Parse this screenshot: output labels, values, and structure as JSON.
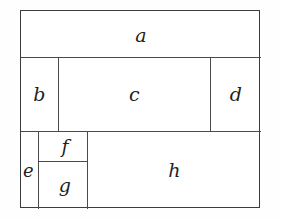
{
  "figure": {
    "outer_border_color": "#3c3c40",
    "divider_color": "#4a4a4e",
    "background_color": "#ffffff",
    "label_color": "#1f1f24",
    "regions": [
      {
        "id": "a",
        "label": "a",
        "row": 1,
        "x": 0,
        "y": 0,
        "w": 240,
        "h": 47
      },
      {
        "id": "b",
        "label": "b",
        "row": 2,
        "x": 0,
        "y": 47,
        "w": 38,
        "h": 74
      },
      {
        "id": "c",
        "label": "c",
        "row": 2,
        "x": 38,
        "y": 47,
        "w": 152,
        "h": 74
      },
      {
        "id": "d",
        "label": "d",
        "row": 2,
        "x": 190,
        "y": 47,
        "w": 50,
        "h": 74
      },
      {
        "id": "e",
        "label": "e",
        "row": 3,
        "x": 0,
        "y": 121,
        "w": 18,
        "h": 77
      },
      {
        "id": "f",
        "label": "f",
        "row": 3,
        "x": 18,
        "y": 121,
        "w": 49,
        "h": 30
      },
      {
        "id": "g",
        "label": "g",
        "row": 3,
        "x": 18,
        "y": 151,
        "w": 49,
        "h": 47
      },
      {
        "id": "h",
        "label": "h",
        "row": 3,
        "x": 67,
        "y": 121,
        "w": 173,
        "h": 77
      }
    ]
  }
}
